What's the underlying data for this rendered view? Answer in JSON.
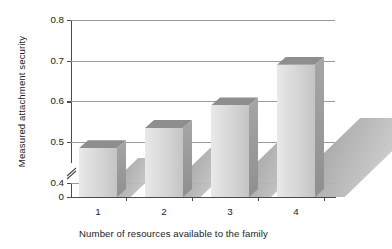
{
  "chart_data": {
    "type": "bar",
    "title": "",
    "xlabel": "Number of resources available to the family",
    "ylabel": "Measured attachment security",
    "categories": [
      "1",
      "2",
      "3",
      "4"
    ],
    "values": [
      0.485,
      0.535,
      0.59,
      0.69
    ],
    "ylim": [
      0,
      0.8
    ],
    "y_ticks": [
      "0",
      "0.4",
      "0.5",
      "0.6",
      "0.7",
      "0.8"
    ],
    "y_tick_values": [
      0,
      0.4,
      0.5,
      0.6,
      0.7,
      0.8
    ],
    "axis_break": true,
    "axis_break_between": [
      0,
      0.4
    ],
    "grid": "horizontal",
    "legend": "none",
    "style": "3d-bars-with-shadow",
    "colors": {
      "bar_face_light": "#e9e9e9",
      "bar_face_dark": "#c4c4c4",
      "bar_top": "#8e8e8e",
      "bar_side": "#9a9a9a",
      "shadow": "#b4b4b4",
      "gridline": "#9b9b9b",
      "axis": "#4b4b4b",
      "text": "#232323",
      "background": "#ffffff"
    }
  }
}
